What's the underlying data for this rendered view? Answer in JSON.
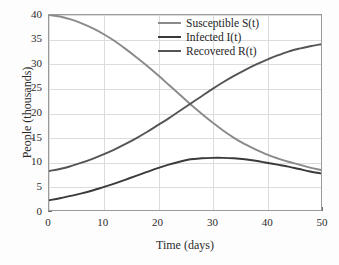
{
  "chart_data": {
    "type": "line",
    "title": "",
    "xlabel": "Time (days)",
    "ylabel": "People (thousands)",
    "xlim": [
      0,
      50
    ],
    "ylim": [
      0,
      40
    ],
    "grid": true,
    "legend_position": "upper right",
    "xticks": [
      "0",
      "10",
      "20",
      "30",
      "40",
      "50"
    ],
    "xtick_values": [
      0,
      10,
      20,
      30,
      40,
      50
    ],
    "yticks": [
      "0",
      "5",
      "10",
      "15",
      "20",
      "25",
      "30",
      "35",
      "40"
    ],
    "ytick_values": [
      0,
      5,
      10,
      15,
      20,
      25,
      30,
      35,
      40
    ],
    "x": [
      0,
      2,
      4,
      6,
      8,
      10,
      12,
      14,
      16,
      18,
      20,
      22,
      24,
      26,
      28,
      30,
      32,
      34,
      36,
      38,
      40,
      42,
      44,
      46,
      48,
      50
    ],
    "series": [
      {
        "name": "Susceptible S(t)",
        "color": "#8a8a8a",
        "values": [
          40.0,
          39.7,
          39.1,
          38.3,
          37.3,
          36.1,
          34.7,
          33.1,
          31.4,
          29.6,
          27.7,
          25.7,
          23.7,
          21.7,
          19.8,
          18.0,
          16.3,
          14.8,
          13.5,
          12.4,
          11.4,
          10.6,
          9.9,
          9.3,
          8.7,
          8.2
        ]
      },
      {
        "name": "Infected I(t)",
        "color": "#3a3a3a",
        "values": [
          2.0,
          2.4,
          2.9,
          3.4,
          4.0,
          4.7,
          5.4,
          6.2,
          7.0,
          7.8,
          8.6,
          9.3,
          9.9,
          10.4,
          10.6,
          10.7,
          10.7,
          10.6,
          10.4,
          10.1,
          9.7,
          9.3,
          8.9,
          8.4,
          7.9,
          7.5
        ]
      },
      {
        "name": "Recovered R(t)",
        "color": "#555555",
        "values": [
          8.0,
          8.4,
          9.0,
          9.7,
          10.5,
          11.4,
          12.4,
          13.5,
          14.7,
          16.0,
          17.4,
          18.8,
          20.3,
          21.8,
          23.3,
          24.8,
          26.2,
          27.5,
          28.7,
          29.8,
          30.8,
          31.7,
          32.5,
          33.1,
          33.6,
          34.0
        ]
      }
    ]
  },
  "legend": {
    "items": [
      {
        "label": "Susceptible S(t)"
      },
      {
        "label": "Infected I(t)"
      },
      {
        "label": "Recovered R(t)"
      }
    ]
  },
  "axes": {
    "x_title": "Time (days)",
    "y_title": "People (thousands)"
  }
}
